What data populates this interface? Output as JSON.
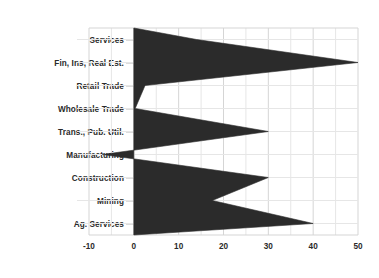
{
  "chart_data": {
    "type": "area",
    "orientation": "horizontal",
    "title": "",
    "subtitle": "",
    "xlabel": "",
    "ylabel": "",
    "categories": [
      "Services",
      "Fin, Ins, Real Est.",
      "Retail Trade",
      "Wholesale Trade",
      "Trans., Pub. Util.",
      "Manufacturing",
      "Construction",
      "Mining",
      "Ag. Services"
    ],
    "values": [
      14,
      50,
      2.5,
      0.3,
      30,
      -7,
      30,
      17.5,
      40
    ],
    "series": [
      {
        "name": "",
        "values": [
          14,
          50,
          2.5,
          0.3,
          30,
          -7,
          30,
          17.5,
          40
        ]
      }
    ],
    "xlim": [
      -10,
      50
    ],
    "xticks": [
      -10,
      0,
      10,
      20,
      30,
      40,
      50
    ],
    "xtick_labels": [
      "-10",
      "0",
      "10",
      "20",
      "30",
      "40",
      "50"
    ],
    "minor_xticks": [
      -5,
      5,
      15,
      25,
      35,
      45
    ],
    "baseline": 0,
    "grid": true,
    "grid_color": "#d5d5d5",
    "minor_grid_color": "#e6e6e6",
    "legend": false,
    "legend_position": "none",
    "fill_color": "#2b2b2b",
    "background_color": "#ffffff",
    "label_color": "#2a2a2a",
    "annotations": []
  }
}
